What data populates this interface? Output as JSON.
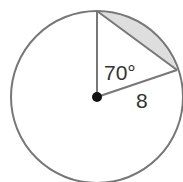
{
  "diagram": {
    "angle_label": "70°",
    "radius_label": "8",
    "colors": {
      "stroke": "#777777",
      "segment_fill": "#dedede",
      "center": "#111111"
    }
  }
}
